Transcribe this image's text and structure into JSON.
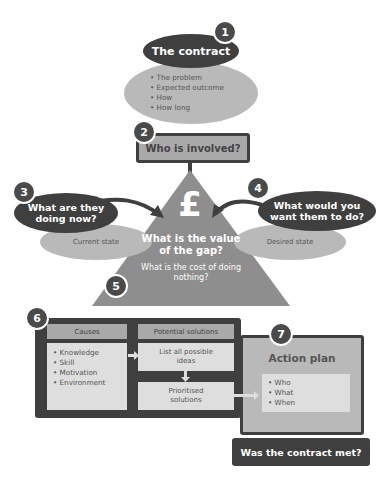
{
  "step1": {
    "number": "1",
    "title": "The contract",
    "items": [
      "The problem",
      "Expected outcome",
      "How",
      "How long"
    ]
  },
  "step2": {
    "number": "2",
    "title": "Who is involved?"
  },
  "step3": {
    "number": "3",
    "title": "What are they doing now?",
    "sub": "Current state"
  },
  "step4": {
    "number": "4",
    "title": "What would you want them to do?",
    "sub": "Desired state"
  },
  "gap": {
    "symbol": "£",
    "question": "What is the value of the gap?",
    "number": "5",
    "cost_question": "What is the cost of doing nothing?"
  },
  "step6": {
    "number": "6",
    "causes_header": "Causes",
    "causes": [
      "Knowledge",
      "Skill",
      "Motivation",
      "Environment"
    ],
    "solutions_header": "Potential solutions",
    "list_ideas": "List all possible ideas",
    "prioritised": "Prioritised solutions"
  },
  "step7": {
    "number": "7",
    "title": "Action plan",
    "items": [
      "Who",
      "What",
      "When"
    ]
  },
  "final": {
    "question": "Was the contract met?"
  },
  "colors": {
    "dark": "#3f3f3f",
    "mid": "#8e8e8e",
    "light": "#b9b9b9",
    "pale": "#dedede"
  }
}
